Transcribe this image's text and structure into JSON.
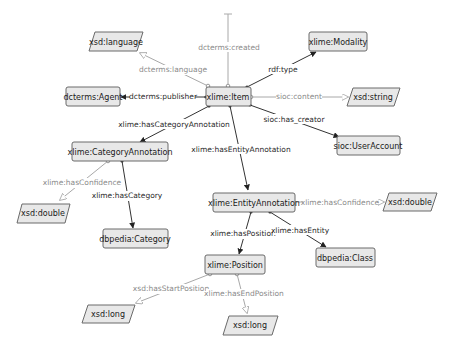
{
  "diagram": {
    "nodes": {
      "item": {
        "label": "xlime:Item",
        "kind": "class"
      },
      "modality": {
        "label": "xlime:Modality",
        "kind": "class"
      },
      "language": {
        "label": "xsd:language",
        "kind": "datatype"
      },
      "agent": {
        "label": "dcterms:Agent",
        "kind": "class"
      },
      "string": {
        "label": "xsd:string",
        "kind": "datatype"
      },
      "useraccount": {
        "label": "sioc:UserAccount",
        "kind": "class"
      },
      "catann": {
        "label": "xlime:CategoryAnnotation",
        "kind": "class"
      },
      "double1": {
        "label": "xsd:double",
        "kind": "datatype"
      },
      "category": {
        "label": "dbpedia:Category",
        "kind": "class"
      },
      "entann": {
        "label": "xlime:EntityAnnotation",
        "kind": "class"
      },
      "double2": {
        "label": "xsd:double",
        "kind": "datatype"
      },
      "dbclass": {
        "label": "dbpedia:Class",
        "kind": "class"
      },
      "position": {
        "label": "xlime:Position",
        "kind": "class"
      },
      "long1": {
        "label": "xsd:long",
        "kind": "datatype"
      },
      "long2": {
        "label": "xsd:long",
        "kind": "datatype"
      }
    },
    "edges": {
      "created": {
        "label": "dcterms:created",
        "type": "data"
      },
      "language": {
        "label": "dcterms:language",
        "type": "data"
      },
      "publisher": {
        "label": "dcterms:publisher",
        "type": "object"
      },
      "rdftype": {
        "label": "rdf:type",
        "type": "object"
      },
      "content": {
        "label": "sioc:content",
        "type": "data"
      },
      "creator": {
        "label": "sioc:has_creator",
        "type": "object"
      },
      "hascatann": {
        "label": "xlime:hasCategoryAnnotation",
        "type": "object"
      },
      "hasentann": {
        "label": "xlime:hasEntityAnnotation",
        "type": "object"
      },
      "catconf": {
        "label": "xlime:hasConfidence",
        "type": "data"
      },
      "hascategory": {
        "label": "xlime:hasCategory",
        "type": "object"
      },
      "entconf": {
        "label": "xlime:hasConfidence",
        "type": "data"
      },
      "hasposition": {
        "label": "xlime:hasPosition",
        "type": "object"
      },
      "hasentity": {
        "label": "xlime:hasEntity",
        "type": "object"
      },
      "startpos": {
        "label": "xsd:hasStartPosition",
        "type": "data"
      },
      "endpos": {
        "label": "xlime:hasEndPosition",
        "type": "data"
      }
    },
    "colors": {
      "node_fill": "#e8e8e8",
      "node_stroke": "#6a6a6a",
      "object_edge": "#333333",
      "data_edge": "#a8a8a8"
    }
  }
}
